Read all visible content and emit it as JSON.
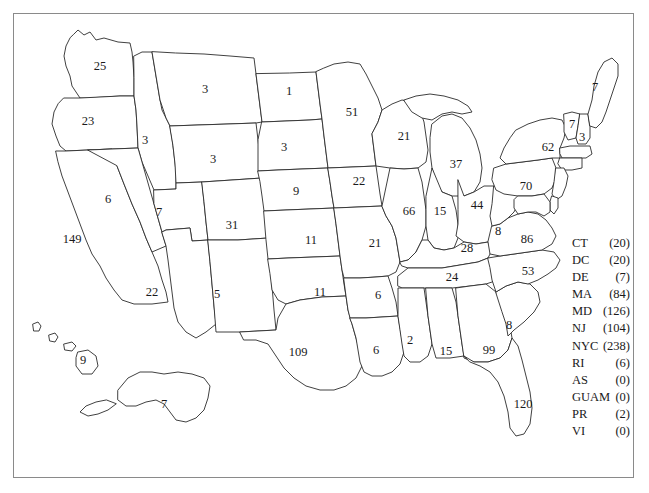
{
  "figure": {
    "type": "choropleth-style annotated US map"
  },
  "map": {
    "states": [
      {
        "abbr": "WA",
        "value": "25",
        "x": 100,
        "y": 66
      },
      {
        "abbr": "OR",
        "value": "23",
        "x": 88,
        "y": 121
      },
      {
        "abbr": "ID",
        "value": "3",
        "x": 145,
        "y": 140
      },
      {
        "abbr": "MT",
        "value": "3",
        "x": 205,
        "y": 89
      },
      {
        "abbr": "WY",
        "value": "3",
        "x": 213,
        "y": 159
      },
      {
        "abbr": "NV",
        "value": "6",
        "x": 108,
        "y": 199
      },
      {
        "abbr": "UT",
        "value": "7",
        "x": 159,
        "y": 212
      },
      {
        "abbr": "CA",
        "value": "149",
        "x": 72,
        "y": 239
      },
      {
        "abbr": "AZ",
        "value": "22",
        "x": 152,
        "y": 292
      },
      {
        "abbr": "CO",
        "value": "31",
        "x": 232,
        "y": 225
      },
      {
        "abbr": "NM",
        "value": "5",
        "x": 217,
        "y": 294
      },
      {
        "abbr": "ND",
        "value": "1",
        "x": 289,
        "y": 91
      },
      {
        "abbr": "SD",
        "value": "3",
        "x": 284,
        "y": 147
      },
      {
        "abbr": "NE",
        "value": "9",
        "x": 296,
        "y": 191
      },
      {
        "abbr": "KS",
        "value": "11",
        "x": 311,
        "y": 240
      },
      {
        "abbr": "OK",
        "value": "11",
        "x": 320,
        "y": 292
      },
      {
        "abbr": "TX",
        "value": "109",
        "x": 298,
        "y": 352
      },
      {
        "abbr": "MN",
        "value": "51",
        "x": 352,
        "y": 112
      },
      {
        "abbr": "IA",
        "value": "22",
        "x": 359,
        "y": 181
      },
      {
        "abbr": "MO",
        "value": "21",
        "x": 375,
        "y": 243
      },
      {
        "abbr": "AR",
        "value": "6",
        "x": 378,
        "y": 295
      },
      {
        "abbr": "LA",
        "value": "6",
        "x": 376,
        "y": 350
      },
      {
        "abbr": "WI",
        "value": "21",
        "x": 404,
        "y": 136
      },
      {
        "abbr": "IL",
        "value": "66",
        "x": 409,
        "y": 211
      },
      {
        "abbr": "MS",
        "value": "2",
        "x": 410,
        "y": 340
      },
      {
        "abbr": "MI",
        "value": "37",
        "x": 456,
        "y": 164
      },
      {
        "abbr": "IN",
        "value": "15",
        "x": 440,
        "y": 211
      },
      {
        "abbr": "KY",
        "value": "28",
        "x": 467,
        "y": 248
      },
      {
        "abbr": "TN",
        "value": "24",
        "x": 452,
        "y": 277
      },
      {
        "abbr": "AL",
        "value": "15",
        "x": 446,
        "y": 351
      },
      {
        "abbr": "OH",
        "value": "44",
        "x": 477,
        "y": 205
      },
      {
        "abbr": "WV",
        "value": "8",
        "x": 498,
        "y": 231
      },
      {
        "abbr": "GA",
        "value": "99",
        "x": 489,
        "y": 350
      },
      {
        "abbr": "SC",
        "value": "8",
        "x": 509,
        "y": 325
      },
      {
        "abbr": "NC",
        "value": "53",
        "x": 528,
        "y": 271
      },
      {
        "abbr": "VA",
        "value": "86",
        "x": 527,
        "y": 239
      },
      {
        "abbr": "PA",
        "value": "70",
        "x": 526,
        "y": 186
      },
      {
        "abbr": "NY",
        "value": "62",
        "x": 548,
        "y": 147
      },
      {
        "abbr": "VT",
        "value": "7",
        "x": 572,
        "y": 124
      },
      {
        "abbr": "NH",
        "value": "3",
        "x": 582,
        "y": 137
      },
      {
        "abbr": "ME",
        "value": "7",
        "x": 595,
        "y": 87
      },
      {
        "abbr": "FL",
        "value": "120",
        "x": 523,
        "y": 404
      },
      {
        "abbr": "AK",
        "value": "7",
        "x": 164,
        "y": 404
      },
      {
        "abbr": "HI",
        "value": "9",
        "x": 83,
        "y": 360
      }
    ]
  },
  "legend": {
    "rows": [
      {
        "abbr": "CT",
        "value": "(20)"
      },
      {
        "abbr": "DC",
        "value": "(20)"
      },
      {
        "abbr": "DE",
        "value": "(7)"
      },
      {
        "abbr": "MA",
        "value": "(84)"
      },
      {
        "abbr": "MD",
        "value": "(126)"
      },
      {
        "abbr": "NJ",
        "value": "(104)"
      },
      {
        "abbr": "NYC",
        "value": "(238)"
      },
      {
        "abbr": "RI",
        "value": "(6)"
      },
      {
        "abbr": "AS",
        "value": "(0)"
      },
      {
        "abbr": "GUAM",
        "value": "(0)"
      },
      {
        "abbr": "PR",
        "value": "(2)"
      },
      {
        "abbr": "VI",
        "value": "(0)"
      }
    ]
  },
  "style": {
    "frame_color": "#8a8a8a",
    "outline_color": "#2b2b2b",
    "fill_color": "#ffffff",
    "text_color": "#1a1a1a"
  }
}
